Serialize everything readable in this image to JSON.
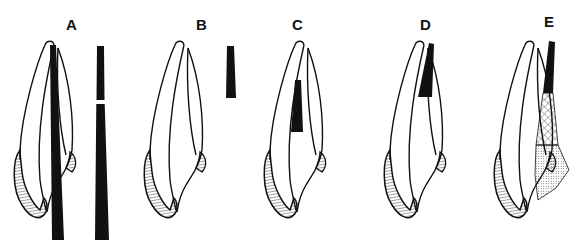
{
  "figure": {
    "panels": [
      {
        "label": "A",
        "description": "Tooth with full-length tapered post spanning the root, separate tapered post shown with a break"
      },
      {
        "label": "B",
        "description": "Tooth without post, short separate tapered post shown"
      },
      {
        "label": "C",
        "description": "Tooth with short post placed in the middle of the canal"
      },
      {
        "label": "D",
        "description": "Tooth with black filling at apical end of canal"
      },
      {
        "label": "E",
        "description": "Tooth with black apical filling, cross-hatched middle section and dotted coronal section"
      }
    ],
    "colors": {
      "ink": "#111111",
      "background": "#ffffff"
    }
  }
}
